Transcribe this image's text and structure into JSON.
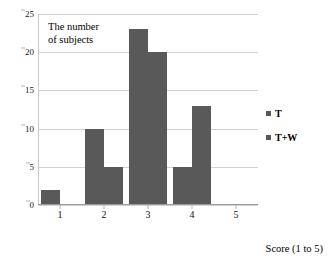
{
  "chart_data": {
    "type": "bar",
    "title": "",
    "categories": [
      "1",
      "2",
      "3",
      "4",
      "5"
    ],
    "series": [
      {
        "name": "T",
        "values": [
          2,
          10,
          23,
          5,
          0
        ]
      },
      {
        "name": "T+W",
        "values": [
          0,
          5,
          20,
          13,
          0
        ]
      }
    ],
    "xlabel": "Score (1 to 5)",
    "ylabel": "The number\nof subjects",
    "ylim": [
      0,
      25
    ],
    "yticks": [
      0,
      5,
      10,
      15,
      20,
      25
    ],
    "ytick_labels": [
      "0",
      "5",
      "10",
      "15",
      "20",
      "25"
    ],
    "grid": true,
    "legend_position": "right",
    "bar_color": "#595959",
    "gridline_color": "#d2d2d2",
    "axis_color": "#9a9a9a"
  },
  "legend": {
    "items": [
      {
        "label": "T"
      },
      {
        "label": "T+W"
      }
    ]
  },
  "axes": {
    "x_title": "Score (1 to 5)",
    "y_title": "The number\nof subjects"
  }
}
